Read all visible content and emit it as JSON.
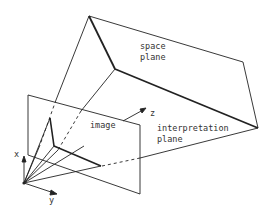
{
  "diagram": {
    "labels": {
      "space_plane_line1": "space",
      "space_plane_line2": "plane",
      "image": "image",
      "interpretation_line1": "interpretation",
      "interpretation_line2": "plane",
      "axis_x": "x",
      "axis_y": "y",
      "axis_z": "z"
    },
    "colors": {
      "line": "#222222",
      "background": "#ffffff"
    }
  }
}
